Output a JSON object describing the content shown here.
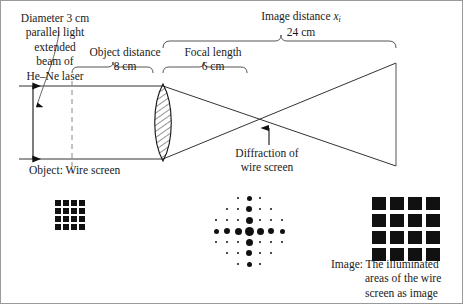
{
  "figure": {
    "type": "optics-ray-diagram",
    "border_color": "#9a9a9a",
    "ink_color": "#111111"
  },
  "labels": {
    "laser_source": "Diameter 3 cm\nparallel light\nextended\nbeam of\nHe–Ne laser",
    "laser_source_lines": [
      "Diameter 3 cm",
      "parallel light",
      "extended",
      "beam of",
      "He–Ne laser"
    ],
    "object_distance_title": "Object distance",
    "object_distance_value": "8 cm",
    "focal_length_title": "Focal length",
    "focal_length_value": "6 cm",
    "image_distance_title": "Image distance",
    "image_distance_symbol": "x",
    "image_distance_subscript": "i",
    "image_distance_value": "24 cm",
    "object_label": "Object:  Wire screen",
    "diffraction_label_line1": "Diffraction of",
    "diffraction_label_line2": "wire screen",
    "image_caption_lead": "Image:  The illuminated",
    "image_caption_line2": "areas of the wire",
    "image_caption_line3": "screen as image"
  },
  "chart_data": {
    "type": "diagram",
    "optical_axis_y": 121,
    "beam": {
      "diameter_cm": 3,
      "top_y": 85,
      "bottom_y": 158,
      "source_x": 18,
      "description": "parallel extended beam of He-Ne laser"
    },
    "object_plane": {
      "label": "Wire screen",
      "x": 71,
      "style": "dashed"
    },
    "lens": {
      "center_x": 162,
      "top_y": 83,
      "bottom_y": 160,
      "half_width": 11,
      "hatched": true
    },
    "focal_point": {
      "x": 268,
      "y": 121
    },
    "image_plane": {
      "x": 395,
      "top_y": 62,
      "bottom_y": 165
    },
    "distances": [
      {
        "name": "Object distance",
        "value": 8,
        "unit": "cm",
        "from_x": 71,
        "to_x": 151
      },
      {
        "name": "Focal length",
        "value": 6,
        "unit": "cm",
        "from_x": 162,
        "to_x": 246
      },
      {
        "name": "Image distance",
        "symbol": "x_i",
        "value": 24,
        "unit": "cm",
        "from_x": 162,
        "to_x": 395
      }
    ],
    "object_grid": {
      "rows": 4,
      "cols": 4,
      "cell_px": 6,
      "gap_px": 2
    },
    "image_grid": {
      "rows": 4,
      "cols": 4,
      "cell_w_px": 14,
      "cell_h_px": 13,
      "gap_px": 4
    },
    "diffraction_pattern": {
      "lattice": "7x7 with corners removed",
      "spacing_px": 11,
      "center": {
        "x": 248,
        "y": 230
      },
      "orders": [
        -3,
        -2,
        -1,
        0,
        1,
        2,
        3
      ],
      "dot_sizes": {
        "center": 9,
        "axis_order1": 7,
        "axis_order2": 6,
        "axis_order3": 5,
        "off_axis": 2.5
      }
    }
  }
}
